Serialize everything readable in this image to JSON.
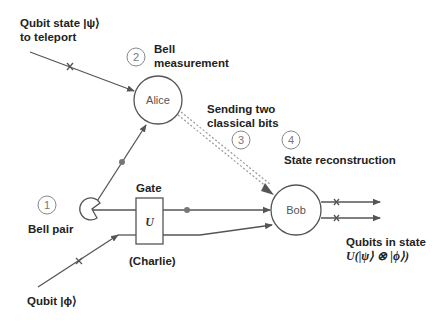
{
  "labels": {
    "qubit_psi_line1": "Qubit state |ψ⟩",
    "qubit_psi_line2": "to teleport",
    "bell_measurement_line1": "Bell",
    "bell_measurement_line2": "measurement",
    "sending_line1": "Sending two",
    "sending_line2": "classical bits",
    "state_reconstruction": "State reconstruction",
    "bell_pair": "Bell pair",
    "gate": "Gate",
    "charlie": "(Charlie)",
    "qubit_phi": "Qubit |ϕ⟩",
    "output_line1": "Qubits in state",
    "output_line2": "U(|ψ⟩ ⊗ |ϕ⟩)"
  },
  "nodes": {
    "alice": "Alice",
    "bob": "Bob",
    "gate_symbol": "U"
  },
  "steps": [
    "1",
    "2",
    "3",
    "4"
  ],
  "colors": {
    "wire": "#555555",
    "node_stroke": "#555555",
    "step_circle": "#888888",
    "classical_channel": "#999999"
  }
}
